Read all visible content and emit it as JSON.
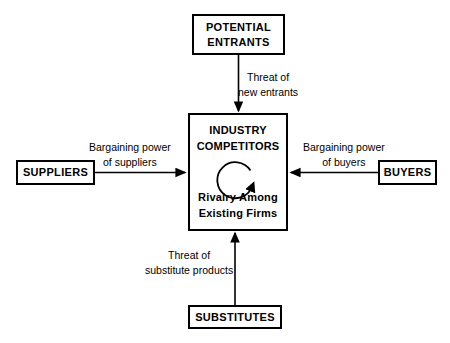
{
  "diagram": {
    "background_color": "#ffffff",
    "line_color": "#000000"
  },
  "boxes": {
    "potential_entrants": {
      "line1": "POTENTIAL",
      "line2": "ENTRANTS"
    },
    "industry_competitors": {
      "title_line1": "INDUSTRY",
      "title_line2": "COMPETITORS",
      "subtitle_line1": "Rivalry Among",
      "subtitle_line2": "Existing Firms"
    },
    "suppliers": {
      "label": "SUPPLIERS"
    },
    "buyers": {
      "label": "BUYERS"
    },
    "substitutes": {
      "label": "SUBSTITUTES"
    }
  },
  "arrow_labels": {
    "threat_of_new_entrants": {
      "line1": "Threat of",
      "line2": "new entrants"
    },
    "bargaining_power_of_suppliers": {
      "line1": "Bargaining power",
      "line2": "of suppliers"
    },
    "bargaining_power_of_buyers": {
      "line1": "Bargaining power",
      "line2": "of buyers"
    },
    "threat_of_substitute_products": {
      "line1": "Threat of",
      "line2": "substitute products"
    }
  },
  "icons": {
    "rivalry_loop": "circular-arrow-icon",
    "arrow_down": "arrow-down-icon",
    "arrow_up": "arrow-up-icon",
    "arrow_right": "arrow-right-icon",
    "arrow_left": "arrow-left-icon"
  }
}
